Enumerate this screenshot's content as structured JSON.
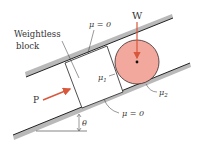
{
  "diagram": {
    "labels": {
      "weight": "W",
      "block_line1": "Weightless",
      "block_line2": "block",
      "mu_top": "μ = 0",
      "mu_bottom": "μ = 0",
      "mu1": "μ",
      "mu1_sub": "1",
      "mu2": "μ",
      "mu2_sub": "2",
      "force": "P",
      "angle": "θ"
    },
    "colors": {
      "rail_fill": "#b9b9b9",
      "rail_edge": "#222222",
      "cylinder_fill": "#f2a89c",
      "cylinder_edge": "#3a2a2a",
      "arrow": "#d9573a",
      "text": "#333333"
    }
  }
}
